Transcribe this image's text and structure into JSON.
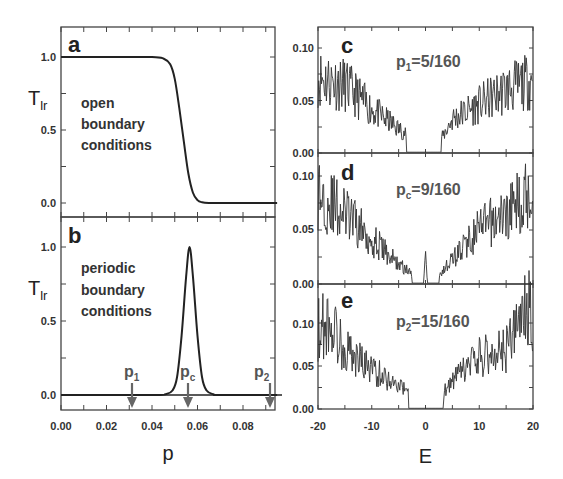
{
  "chart_data": [
    {
      "id": "a",
      "type": "line",
      "panel_label": "a",
      "annotation": [
        "open",
        "boundary",
        "conditions"
      ],
      "xlabel": "p",
      "ylabel": "T_lr",
      "xlim": [
        0.0,
        0.095
      ],
      "ylim": [
        -0.1,
        1.2
      ],
      "xticks": [
        "0.00",
        "0.02",
        "0.04",
        "0.06",
        "0.08"
      ],
      "yticks": [
        "0.0",
        "0.5",
        "1.0"
      ],
      "x": [
        0.0,
        0.02,
        0.04,
        0.045,
        0.048,
        0.05,
        0.052,
        0.054,
        0.056,
        0.058,
        0.06,
        0.062,
        0.065,
        0.07,
        0.08,
        0.095
      ],
      "values": [
        1.0,
        1.0,
        1.0,
        0.99,
        0.95,
        0.85,
        0.65,
        0.42,
        0.2,
        0.07,
        0.02,
        0.005,
        0.0,
        0.0,
        0.0,
        0.0
      ]
    },
    {
      "id": "b",
      "type": "line",
      "panel_label": "b",
      "annotation": [
        "periodic",
        "boundary",
        "conditions"
      ],
      "xlabel": "p",
      "ylabel": "T_lr",
      "xlim": [
        0.0,
        0.095
      ],
      "ylim": [
        -0.1,
        1.2
      ],
      "xticks": [
        "0.00",
        "0.02",
        "0.04",
        "0.06",
        "0.08"
      ],
      "yticks": [
        "0.0",
        "0.5",
        "1.0"
      ],
      "x": [
        0.0,
        0.04,
        0.046,
        0.049,
        0.051,
        0.053,
        0.055,
        0.0565,
        0.058,
        0.06,
        0.062,
        0.064,
        0.067,
        0.07,
        0.095
      ],
      "values": [
        0.0,
        0.0,
        0.005,
        0.03,
        0.12,
        0.4,
        0.8,
        1.0,
        0.8,
        0.4,
        0.12,
        0.03,
        0.005,
        0.0,
        0.0
      ],
      "markers": [
        {
          "label": "p1",
          "sub": "1",
          "x": 0.0313
        },
        {
          "label": "pc",
          "sub": "c",
          "x": 0.0563
        },
        {
          "label": "p2",
          "sub": "2",
          "x": 0.0938
        }
      ]
    },
    {
      "id": "c",
      "type": "line",
      "panel_label": "c",
      "annotation": "p1=5/160",
      "xlabel": "E",
      "xlim": [
        -20,
        20
      ],
      "ylim": [
        0.0,
        0.12
      ],
      "yticks": [
        "0.00",
        "0.05",
        "0.10"
      ],
      "gap": [
        -3.5,
        3
      ],
      "envelope_left": [
        [
          -20,
          0.078
        ],
        [
          -15,
          0.07
        ],
        [
          -10,
          0.045
        ],
        [
          -5,
          0.025
        ],
        [
          -3.5,
          0.02
        ]
      ],
      "envelope_right": [
        [
          3,
          0.015
        ],
        [
          5,
          0.035
        ],
        [
          10,
          0.05
        ],
        [
          15,
          0.065
        ],
        [
          20,
          0.075
        ]
      ]
    },
    {
      "id": "d",
      "type": "line",
      "panel_label": "d",
      "annotation": "pc=9/160",
      "xlabel": "E",
      "xlim": [
        -20,
        20
      ],
      "ylim": [
        0.0,
        0.12
      ],
      "yticks": [
        "0.00",
        "0.05",
        "0.10"
      ],
      "gap": [
        -2.5,
        2.5
      ],
      "center_peak": [
        0,
        0.032
      ],
      "envelope_left": [
        [
          -20,
          0.09
        ],
        [
          -15,
          0.07
        ],
        [
          -10,
          0.045
        ],
        [
          -5,
          0.02
        ],
        [
          -2.5,
          0.01
        ]
      ],
      "envelope_right": [
        [
          2.5,
          0.01
        ],
        [
          5,
          0.025
        ],
        [
          10,
          0.055
        ],
        [
          15,
          0.07
        ],
        [
          20,
          0.095
        ]
      ]
    },
    {
      "id": "e",
      "type": "line",
      "panel_label": "e",
      "annotation": "p2=15/160",
      "xlabel": "E",
      "xlim": [
        -20,
        20
      ],
      "ylim": [
        0.0,
        0.15
      ],
      "xticks": [
        "-20",
        "-10",
        "0",
        "10",
        "20"
      ],
      "yticks": [
        "0.00",
        "0.05",
        "0.10"
      ],
      "gap": [
        -3.2,
        3.3
      ],
      "envelope_left": [
        [
          -20,
          0.1
        ],
        [
          -18,
          0.11
        ],
        [
          -15,
          0.075
        ],
        [
          -10,
          0.05
        ],
        [
          -5,
          0.03
        ],
        [
          -3.2,
          0.02
        ]
      ],
      "envelope_right": [
        [
          3.3,
          0.02
        ],
        [
          5,
          0.035
        ],
        [
          10,
          0.065
        ],
        [
          15,
          0.075
        ],
        [
          19,
          0.13
        ],
        [
          20,
          0.11
        ]
      ]
    }
  ],
  "labels": {
    "a": "a",
    "b": "b",
    "c": "c",
    "d": "d",
    "e": "e",
    "annot_a": [
      "open",
      "boundary",
      "conditions"
    ],
    "annot_b": [
      "periodic",
      "boundary",
      "conditions"
    ],
    "c_main": "p",
    "c_sub": "1",
    "c_rest": "=5/160",
    "d_main": "p",
    "d_sub": "c",
    "d_rest": "=9/160",
    "e_main": "p",
    "e_sub": "2",
    "e_rest": "=15/160",
    "ylabel_main": "T",
    "ylabel_sub": "lr",
    "xlabel_left": "p",
    "xlabel_right": "E",
    "left_xticks": [
      "0.00",
      "0.02",
      "0.04",
      "0.06",
      "0.08"
    ],
    "left_yticks": [
      "0.0",
      "0.5",
      "1.0"
    ],
    "right_yticks": [
      "0.00",
      "0.05",
      "0.10"
    ],
    "right_xticks": [
      "-20",
      "-10",
      "0",
      "10",
      "20"
    ],
    "markers": [
      {
        "main": "p",
        "sub": "1"
      },
      {
        "main": "p",
        "sub": "c"
      },
      {
        "main": "p",
        "sub": "2"
      }
    ]
  },
  "colors": {
    "frame": "#444444",
    "curve": "#222222",
    "noise": "#333333",
    "marker": "#666666"
  }
}
